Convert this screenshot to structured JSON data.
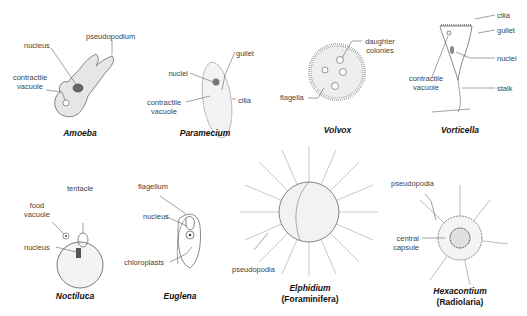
{
  "organisms": [
    {
      "name": "Amoeba",
      "labels": [
        "pseudopodium",
        "nucleus",
        "contractile",
        "vacuole"
      ]
    },
    {
      "name": "Paramecium",
      "labels": [
        "gullet",
        "nuclei",
        "contractile",
        "vacuole",
        "cilia"
      ]
    },
    {
      "name": "Volvox",
      "labels": [
        "daughter",
        "colonies",
        "flagella"
      ]
    },
    {
      "name": "Vorticella",
      "labels": [
        "cilia",
        "gullet",
        "nuclei",
        "contractile",
        "vacuole",
        "stalk"
      ]
    },
    {
      "name": "Noctiluca",
      "labels": [
        "tentacle",
        "food",
        "vacuole",
        "nucleus"
      ]
    },
    {
      "name": "Euglena",
      "labels": [
        "flagellum",
        "nucleus",
        "chloroplasts"
      ]
    },
    {
      "name": "Elphidium",
      "subtitle": "(Foraminifera)",
      "labels": [
        "pseudopodia"
      ]
    },
    {
      "name": "Hexacontium",
      "subtitle": "(Radiolaria)",
      "labels": [
        "pseudopodia",
        "central",
        "capsule"
      ]
    }
  ]
}
